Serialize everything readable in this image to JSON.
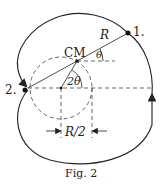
{
  "figure": {
    "caption": "Fig. 2",
    "labels": {
      "point1": "1.",
      "point2": "2.",
      "center_of_mass": "CM",
      "radius": "R",
      "angle_theta": "θ",
      "angle_2theta": "2θ",
      "half_radius": "R/2"
    },
    "colors": {
      "stroke": "#222222",
      "dashed": "#555555"
    }
  }
}
